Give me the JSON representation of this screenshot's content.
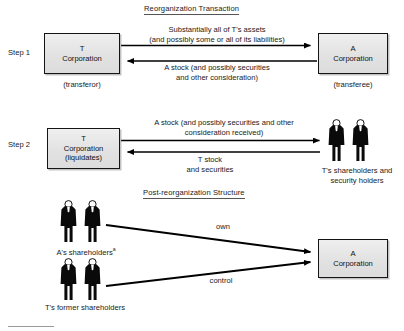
{
  "diagram": {
    "title_reorganization": "Reorganization Transaction",
    "title_post_reorg": "Post-reorganization Structure",
    "colors": {
      "box_fill": "#e4e4e4",
      "box_border": "#141414",
      "arrow": "#000000",
      "text": "#1a1a1a",
      "background": "#ffffff"
    }
  },
  "step1": {
    "step_label": "Step 1",
    "left_box": {
      "line1": "T",
      "line2": "Corporation"
    },
    "left_caption": "(transferor)",
    "right_box": {
      "line1": "A",
      "line2": "Corporation"
    },
    "right_caption": "(transferee)",
    "arrow_forward_label_line1": "Substantially all of T's assets",
    "arrow_forward_label_line2": "(and possibly some or all of its liabilities)",
    "arrow_back_label_line1": "A stock (and possibly securities",
    "arrow_back_label_line2": "and other consideration)"
  },
  "step2": {
    "step_label": "Step 2",
    "left_box": {
      "line1": "T",
      "line2": "Corporation",
      "line3": "(liquidates)"
    },
    "arrow_forward_label_line1": "A stock (and possibly securities and other",
    "arrow_forward_label_line2": "consideration received)",
    "arrow_back_label_line1": "T stock",
    "arrow_back_label_line2": "and securities",
    "people_caption_line1": "T's shareholders and",
    "people_caption_line2": "security holders"
  },
  "post_reorg": {
    "group_a_caption": "A's shareholders",
    "group_a_caption_superscript": "a",
    "group_t_caption": "T's former shareholders",
    "arrow_own_label": "own",
    "arrow_control_label": "control",
    "target_box": {
      "line1": "A",
      "line2": "Corporation"
    }
  },
  "icons": {
    "person": "person-silhouette-icon"
  }
}
